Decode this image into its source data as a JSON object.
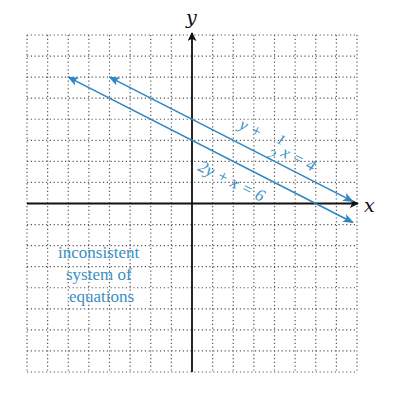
{
  "chart_data": {
    "type": "line",
    "title": "",
    "xlabel": "x",
    "ylabel": "y",
    "xlim": [
      -8,
      8
    ],
    "ylim": [
      -8,
      8
    ],
    "grid": true,
    "grid_style": "dotted",
    "series": [
      {
        "name": "y + 1/2 x = 4",
        "label_parts": [
          "y + ",
          "1",
          "2",
          "x = 4"
        ],
        "slope": -0.5,
        "intercept": 4,
        "x_range": [
          -4,
          7.8
        ],
        "arrows": "both",
        "color": "#2f86c2"
      },
      {
        "name": "2y + x = 6",
        "label_parts": [
          "2y + x = 6"
        ],
        "slope": -0.5,
        "intercept": 3,
        "x_range": [
          -6,
          7.8
        ],
        "arrows": "both",
        "color": "#2f86c2"
      }
    ],
    "annotations": [
      "inconsistent",
      "system of",
      "equations"
    ]
  },
  "colors": {
    "line": "#2f86c2",
    "text_accent": "#3a8fc4",
    "axis": "#111111",
    "grid": "#555555"
  }
}
